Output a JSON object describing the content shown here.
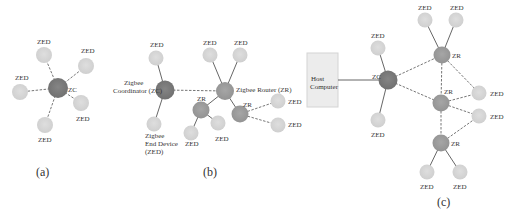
{
  "diagram": {
    "colors": {
      "coordinator": "#7a7a7a",
      "router": "#9a9a9a",
      "end_device": "#d4d4d4",
      "host": "#ececec",
      "edge": "#666666"
    },
    "panels": [
      {
        "id": "a",
        "caption": "(a)",
        "topology": "star",
        "nodes": [
          {
            "id": "a-zc",
            "type": "ZC",
            "label": "ZC"
          },
          {
            "id": "a-zed1",
            "type": "ZED",
            "label": "ZED"
          },
          {
            "id": "a-zed2",
            "type": "ZED",
            "label": "ZED"
          },
          {
            "id": "a-zed3",
            "type": "ZED",
            "label": "ZED"
          },
          {
            "id": "a-zed4",
            "type": "ZED",
            "label": "ZED"
          },
          {
            "id": "a-zed5",
            "type": "ZED",
            "label": "ZED"
          }
        ]
      },
      {
        "id": "b",
        "caption": "(b)",
        "topology": "tree",
        "legend_labels": {
          "coordinator": "Zigbee Coordinator (ZC)",
          "coordinator_line1": "Zigbee",
          "coordinator_line2": "Coordinator (ZC)",
          "router": "Zigbee  Router (ZR)",
          "end_device_line1": "Zigbee",
          "end_device_line2": "End Device",
          "end_device_line3": "(ZED)"
        },
        "nodes": [
          {
            "id": "b-zc",
            "type": "ZC",
            "label": "Zigbee Coordinator (ZC)"
          },
          {
            "id": "b-zed-top",
            "type": "ZED",
            "label": "ZED"
          },
          {
            "id": "b-zed-bottom",
            "type": "ZED",
            "label": "Zigbee End Device (ZED)"
          },
          {
            "id": "b-zr-main",
            "type": "ZR",
            "label": "Zigbee  Router (ZR)"
          },
          {
            "id": "b-zed-m1",
            "type": "ZED",
            "label": "ZED"
          },
          {
            "id": "b-zed-m2",
            "type": "ZED",
            "label": "ZED"
          },
          {
            "id": "b-zr-left",
            "type": "ZR",
            "label": "ZR"
          },
          {
            "id": "b-zr-right",
            "type": "ZR",
            "label": "ZR"
          },
          {
            "id": "b-zed-l1",
            "type": "ZED",
            "label": "ZED"
          },
          {
            "id": "b-zed-l2",
            "type": "ZED",
            "label": "ZED"
          },
          {
            "id": "b-zed-r1",
            "type": "ZED",
            "label": "ZED"
          },
          {
            "id": "b-zed-r2",
            "type": "ZED",
            "label": "ZED"
          }
        ]
      },
      {
        "id": "c",
        "caption": "(c)",
        "topology": "mesh",
        "host": {
          "line1": "Host",
          "line2": "Computer"
        },
        "nodes": [
          {
            "id": "c-zc",
            "type": "ZC",
            "label": "ZC"
          },
          {
            "id": "c-zed-top",
            "type": "ZED",
            "label": "ZED"
          },
          {
            "id": "c-zed-bottom",
            "type": "ZED",
            "label": "ZED"
          },
          {
            "id": "c-zr-top",
            "type": "ZR",
            "label": "ZR"
          },
          {
            "id": "c-zed-t1",
            "type": "ZED",
            "label": "ZED"
          },
          {
            "id": "c-zed-t2",
            "type": "ZED",
            "label": "ZED"
          },
          {
            "id": "c-zr-mid",
            "type": "ZR",
            "label": "ZR"
          },
          {
            "id": "c-zed-m1",
            "type": "ZED",
            "label": "ZED"
          },
          {
            "id": "c-zed-m2",
            "type": "ZED",
            "label": "ZED"
          },
          {
            "id": "c-zr-bottom",
            "type": "ZR",
            "label": "ZR"
          },
          {
            "id": "c-zed-b1",
            "type": "ZED",
            "label": "ZED"
          },
          {
            "id": "c-zed-b2",
            "type": "ZED",
            "label": "ZED"
          }
        ]
      }
    ],
    "labels": {
      "zed": "ZED",
      "zc": "ZC",
      "zr": "ZR"
    }
  }
}
